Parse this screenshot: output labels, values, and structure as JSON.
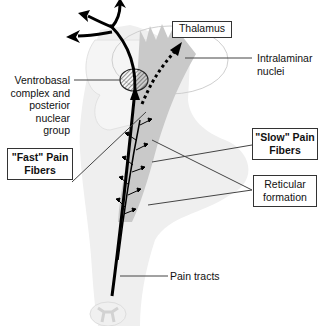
{
  "diagram": {
    "type": "anatomical pain pathway diagram",
    "colors": {
      "brainstem_fill": "#ececec",
      "cortex_fill": "#f3f3f3",
      "reticular_fill": "#c8c8c8",
      "fiber_stroke": "#000000",
      "leader_line": "#444444"
    },
    "labels": {
      "thalamus": "Thalamus",
      "intralaminar_line1": "Intralaminar",
      "intralaminar_line2": "nuclei",
      "ventrobasal_line1": "Ventrobasal",
      "ventrobasal_line2": "complex and",
      "ventrobasal_line3": "posterior",
      "ventrobasal_line4": "nuclear",
      "ventrobasal_line5": "group",
      "fast_line1": "\"Fast\" Pain",
      "fast_line2": "Fibers",
      "slow_line1": "\"Slow\" Pain",
      "slow_line2": "Fibers",
      "reticular_line1": "Reticular",
      "reticular_line2": "formation",
      "pain_tracts": "Pain tracts"
    }
  }
}
